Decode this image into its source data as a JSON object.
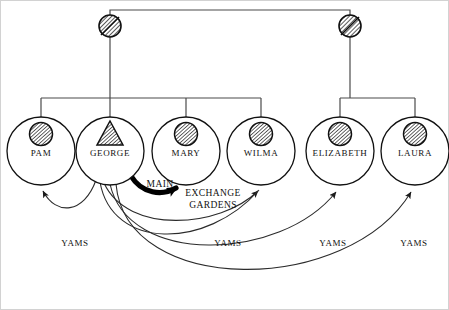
{
  "diagram": {
    "frame_color": "#cfcfcf",
    "line_color": "#2b2b2b",
    "hatch_color": "#1a1a1a",
    "persons": [
      {
        "id": "pam",
        "label": "PAM",
        "cx": 41,
        "cy": 151,
        "r": 34,
        "symbol": "female-circle-hatched"
      },
      {
        "id": "george",
        "label": "GEORGE",
        "cx": 110,
        "cy": 151,
        "r": 34,
        "symbol": "male-triangle-hatched"
      },
      {
        "id": "mary",
        "label": "MARY",
        "cx": 186,
        "cy": 151,
        "r": 34,
        "symbol": "female-circle-hatched"
      },
      {
        "id": "wilma",
        "label": "WILMA",
        "cx": 261,
        "cy": 151,
        "r": 34,
        "symbol": "female-circle-hatched"
      },
      {
        "id": "elizabeth",
        "label": "ELIZABETH",
        "cx": 340,
        "cy": 151,
        "r": 34,
        "symbol": "female-circle-hatched"
      },
      {
        "id": "laura",
        "label": "LAURA",
        "cx": 415,
        "cy": 151,
        "r": 34,
        "symbol": "female-circle-hatched"
      }
    ],
    "marriage_nodes": [
      {
        "id": "marriage-left",
        "cx": 110,
        "cy": 26,
        "r": 11,
        "symbol": "marriage-node-slashed"
      },
      {
        "id": "marriage-right",
        "cx": 350,
        "cy": 26,
        "r": 11,
        "symbol": "marriage-node-slashed"
      }
    ],
    "descent_links": {
      "top_bar_y": 10,
      "left_family_bar_y": 98,
      "left_family_children": [
        "pam",
        "george",
        "mary",
        "wilma"
      ],
      "right_family_bar_y": 98,
      "right_family_children": [
        "elizabeth",
        "laura"
      ]
    },
    "exchanges": [
      {
        "id": "main",
        "label": "MAIN",
        "from": "george",
        "to": "mary",
        "style": "thick",
        "label_x": 160,
        "label_y": 187
      },
      {
        "id": "exchange-gardens",
        "label": "EXCHANGE\nGARDENS",
        "line1": "EXCHANGE",
        "line2": "GARDENS",
        "from": "george",
        "to": "wilma",
        "style": "thin",
        "label_x": 213,
        "label_y": 196
      },
      {
        "id": "yams-pam",
        "label": "YAMS",
        "from": "george",
        "to": "pam",
        "style": "thin",
        "label_x": 75,
        "label_y": 246
      },
      {
        "id": "yams-wilma",
        "label": "YAMS",
        "from": "george",
        "to": "wilma",
        "style": "thin",
        "label_x": 228,
        "label_y": 246
      },
      {
        "id": "yams-elizabeth",
        "label": "YAMS",
        "from": "george",
        "to": "elizabeth",
        "style": "thin",
        "label_x": 333,
        "label_y": 246
      },
      {
        "id": "yams-laura",
        "label": "YAMS",
        "from": "george",
        "to": "laura",
        "style": "thin",
        "label_x": 414,
        "label_y": 246
      }
    ]
  }
}
